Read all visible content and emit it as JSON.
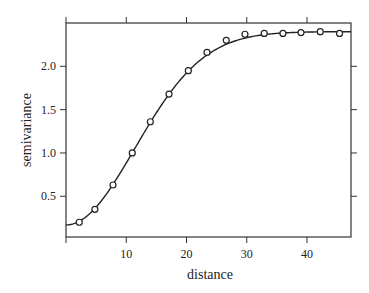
{
  "chart_data": {
    "type": "scatter",
    "title": "",
    "xlabel": "distance",
    "ylabel": "semivariance",
    "xlim": [
      0,
      47.3
    ],
    "ylim": [
      0.03,
      2.5
    ],
    "x_ticks": [
      10,
      20,
      30,
      40
    ],
    "x_tick_labels": [
      "10",
      "20",
      "30",
      "40"
    ],
    "y_ticks": [
      0.5,
      1.0,
      1.5,
      2.0
    ],
    "y_tick_labels": [
      "0.5",
      "1.0",
      "1.5",
      "2.0"
    ],
    "grid": false,
    "legend": null,
    "series": [
      {
        "name": "empirical semivariance",
        "kind": "points",
        "marker": "open-circle",
        "x": [
          2.2,
          4.8,
          7.8,
          11.0,
          14.0,
          17.1,
          20.3,
          23.4,
          26.6,
          29.7,
          32.9,
          36.0,
          39.0,
          42.2,
          45.4
        ],
        "y": [
          0.2,
          0.35,
          0.63,
          1.0,
          1.36,
          1.68,
          1.95,
          2.16,
          2.3,
          2.37,
          2.38,
          2.38,
          2.39,
          2.4,
          2.38
        ]
      },
      {
        "name": "fitted model",
        "kind": "line",
        "model": "gaussian",
        "nugget": 0.17,
        "sill": 2.4,
        "range": 16.1,
        "x_range": [
          0,
          47.3
        ]
      }
    ],
    "colors": {
      "line": "#222222",
      "marker": "#222222",
      "frame": "#333333"
    }
  }
}
